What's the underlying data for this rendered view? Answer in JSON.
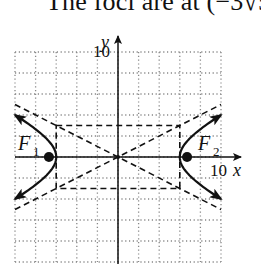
{
  "caption": {
    "text": "The foci are at (−3√5, 0)"
  },
  "chart_data": {
    "type": "line",
    "xlabel": "x",
    "ylabel": "y",
    "xlim": [
      -10,
      10
    ],
    "ylim": [
      -10,
      10
    ],
    "grid": true,
    "grid_step": 2,
    "tick_labels": {
      "x": "10",
      "y": "10"
    },
    "center": [
      0,
      0
    ],
    "vertices": [
      [
        -6,
        0
      ],
      [
        6,
        0
      ]
    ],
    "foci": [
      {
        "label": "F1",
        "sub": "1",
        "x": -6.708,
        "y": 0
      },
      {
        "label": "F2",
        "sub": "2",
        "x": 6.708,
        "y": 0
      }
    ],
    "a": 6,
    "b": 3,
    "asymptotes": [
      "y = x/2",
      "y = -x/2"
    ],
    "central_rectangle": {
      "x": [
        -6,
        6
      ],
      "y": [
        -3,
        3
      ]
    },
    "annotations": [
      "F1",
      "F2"
    ]
  },
  "labels": {
    "y_axis": "y",
    "x_axis": "x",
    "y_tick": "10",
    "x_tick": "10",
    "f1": "F",
    "f1_sub": "1",
    "f2": "F",
    "f2_sub": "2"
  }
}
